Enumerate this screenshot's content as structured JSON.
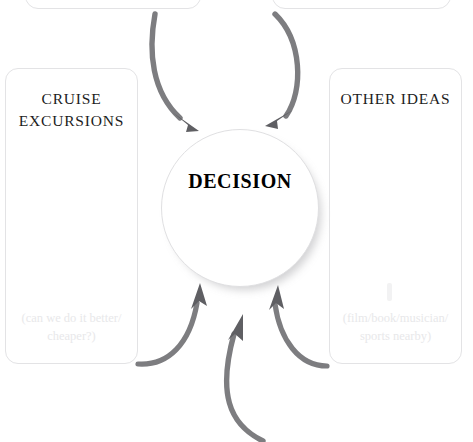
{
  "diagram": {
    "center": {
      "label": "DECISION",
      "shape": "circle"
    },
    "boxes": [
      {
        "name": "top-left",
        "title": "",
        "hint": "",
        "cropped": true
      },
      {
        "name": "top-right",
        "title": "",
        "hint": "",
        "cropped": true
      },
      {
        "name": "cruise-excursions",
        "title": "CRUISE EXCURSIONS",
        "hint": "(can we do it better/ cheaper?)"
      },
      {
        "name": "other-ideas",
        "title": "OTHER IDEAS",
        "hint": "(film/book/musician/ sports nearby)"
      }
    ],
    "arrows": [
      {
        "name": "arrow-top-left-to-center",
        "direction": "down-right"
      },
      {
        "name": "arrow-top-right-to-center",
        "direction": "down-left"
      },
      {
        "name": "arrow-bottom-left-to-center",
        "direction": "up-right"
      },
      {
        "name": "arrow-bottom-center-to-center",
        "direction": "up"
      },
      {
        "name": "arrow-bottom-right-to-center",
        "direction": "up-left"
      }
    ],
    "colors": {
      "background": "#ffffff",
      "box_border": "#e3e3e5",
      "title_text": "#1c1c1c",
      "hint_text": "#e8e8ea",
      "arrow": "#7d7d80",
      "circle_border": "#e0e0e2"
    }
  }
}
